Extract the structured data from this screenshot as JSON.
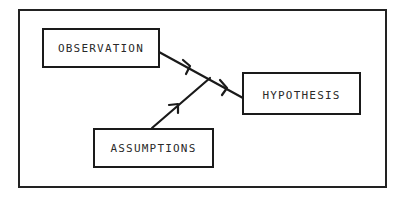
{
  "diagram": {
    "type": "flow-diagram",
    "nodes": [
      {
        "id": "observation",
        "label": "OBSERVATION"
      },
      {
        "id": "assumptions",
        "label": "ASSUMPTIONS"
      },
      {
        "id": "hypothesis",
        "label": "HYPOTHESIS"
      }
    ],
    "edges": [
      {
        "from": "observation",
        "to": "hypothesis"
      },
      {
        "from": "assumptions",
        "to": "hypothesis",
        "merge": "joins observation arrow"
      }
    ],
    "colors": {
      "stroke": "#1a1a1a",
      "background": "#ffffff"
    }
  }
}
